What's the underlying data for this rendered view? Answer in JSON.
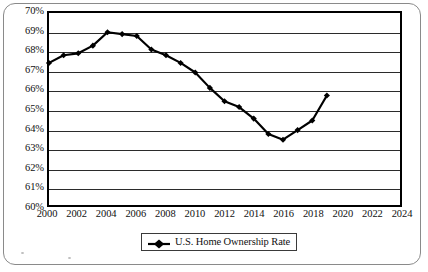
{
  "chart_data": {
    "type": "line",
    "title": "",
    "subtitle": "",
    "xlabel": "",
    "ylabel": "",
    "grid": true,
    "legend_position": "bottom",
    "xlim": [
      2000,
      2024
    ],
    "ylim": [
      60,
      70
    ],
    "ytick_labels": [
      "70%",
      "69%",
      "68%",
      "67%",
      "66%",
      "65%",
      "64%",
      "63%",
      "62%",
      "61%",
      "60%"
    ],
    "ytick_values": [
      70,
      69,
      68,
      67,
      66,
      65,
      64,
      63,
      62,
      61,
      60
    ],
    "xtick_labels": [
      "2000",
      "2002",
      "2004",
      "2006",
      "2008",
      "2010",
      "2012",
      "2014",
      "2016",
      "2018",
      "2020",
      "2022",
      "2024"
    ],
    "xtick_values": [
      2000,
      2002,
      2004,
      2006,
      2008,
      2010,
      2012,
      2014,
      2016,
      2018,
      2020,
      2022,
      2024
    ],
    "series": [
      {
        "name": "U.S. Home Ownership Rate",
        "color": "#000000",
        "marker": "diamond",
        "x": [
          2000,
          2001,
          2002,
          2003,
          2004,
          2005,
          2006,
          2007,
          2008,
          2009,
          2010,
          2011,
          2012,
          2013,
          2014,
          2015,
          2016,
          2017,
          2018,
          2019
        ],
        "values": [
          67.4,
          67.8,
          67.9,
          68.3,
          69.0,
          68.9,
          68.8,
          68.1,
          67.8,
          67.4,
          66.9,
          66.1,
          65.4,
          65.1,
          64.5,
          63.7,
          63.4,
          63.9,
          64.4,
          65.7
        ]
      }
    ]
  },
  "legend": {
    "entries": [
      {
        "label": "U.S. Home Ownership Rate",
        "marker": "line-diamond-marker",
        "color": "#000000"
      }
    ]
  },
  "colors": {
    "axis": "#000000",
    "gridline": "#2b2b2b",
    "series": "#000000",
    "frame": "#8a8a8a",
    "background": "#ffffff"
  }
}
